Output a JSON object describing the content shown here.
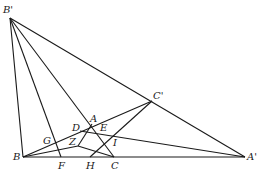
{
  "diagram": {
    "type": "geometry",
    "points": {
      "Bp": {
        "label": "B'",
        "x": 10,
        "y": 18,
        "lx": 3,
        "ly": 13
      },
      "Cp": {
        "label": "C'",
        "x": 152,
        "y": 101,
        "lx": 153,
        "ly": 99
      },
      "Ap": {
        "label": "A'",
        "x": 245,
        "y": 157,
        "lx": 247,
        "ly": 160
      },
      "B": {
        "label": "B",
        "x": 23,
        "y": 157,
        "lx": 13,
        "ly": 160
      },
      "F": {
        "label": "F",
        "x": 61,
        "y": 157,
        "lx": 58,
        "ly": 169
      },
      "H": {
        "label": "H",
        "x": 90,
        "y": 157,
        "lx": 86,
        "ly": 169
      },
      "C": {
        "label": "C",
        "x": 114,
        "y": 157,
        "lx": 111,
        "ly": 169
      },
      "A": {
        "label": "A",
        "x": 92,
        "y": 124,
        "lx": 90,
        "ly": 122
      },
      "D": {
        "label": "D",
        "x": 80,
        "y": 131,
        "lx": 72,
        "ly": 131
      },
      "E": {
        "label": "E",
        "x": 100,
        "y": 132,
        "lx": 100,
        "ly": 131
      },
      "Z": {
        "label": "Z",
        "x": 78,
        "y": 146,
        "lx": 69,
        "ly": 145
      },
      "I": {
        "label": "I",
        "x": 117,
        "y": 142,
        "lx": 113,
        "ly": 146
      },
      "G": {
        "label": "G",
        "x": 50,
        "y": 142,
        "lx": 43,
        "ly": 144
      }
    },
    "segments": [
      [
        "Bp",
        "B"
      ],
      [
        "Bp",
        "F"
      ],
      [
        "Bp",
        "C"
      ],
      [
        "Bp",
        "Ap"
      ],
      [
        "B",
        "Ap"
      ],
      [
        "B",
        "Cp"
      ],
      [
        "B",
        "Z"
      ],
      [
        "Z",
        "C"
      ],
      [
        "D",
        "Ap"
      ],
      [
        "Z",
        "A"
      ],
      [
        "H",
        "Cp"
      ]
    ]
  }
}
